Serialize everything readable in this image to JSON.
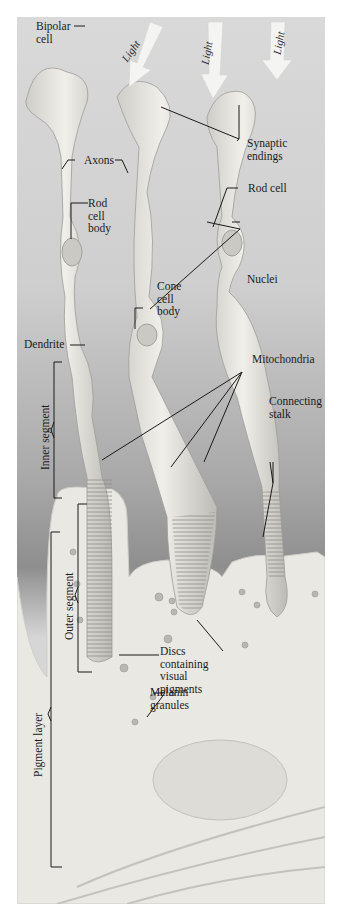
{
  "figure": {
    "type": "anatomical-illustration",
    "colors": {
      "background_light": "#d6d6d6",
      "background_dark": "#8e8e8e",
      "cell_fill": "#e6e4df",
      "pigment_layer": "#ecebe6",
      "leader_line": "#1a1a1a"
    },
    "light_arrows": [
      {
        "label": "Light"
      },
      {
        "label": "Light"
      },
      {
        "label": "Light"
      }
    ],
    "labels": {
      "bipolar_cell": "Bipolar\ncell",
      "synaptic_endings": "Synaptic\nendings",
      "axons": "Axons",
      "rod_cell": "Rod cell",
      "rod_cell_body": "Rod\ncell\nbody",
      "nuclei": "Nuclei",
      "cone_cell_body": "Cone\ncell\nbody",
      "dendrite": "Dendrite",
      "mitochondria": "Mitochondria",
      "connecting_stalk": "Connecting\nstalk",
      "inner_segment": "Inner segment",
      "outer_segment": "Outer segment",
      "pigment_layer": "Pigment layer",
      "discs": "Discs\ncontaining\nvisual\npigments",
      "melanin_granules": "Melanin\ngranules"
    }
  }
}
